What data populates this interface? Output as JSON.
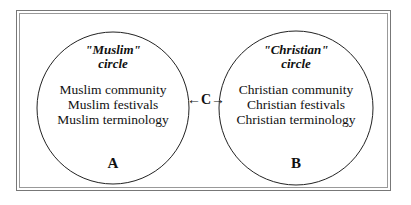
{
  "circles": [
    {
      "heading_line1": "\"Muslim\"",
      "heading_line2": "circle",
      "items": [
        "Muslim community",
        "Muslim festivals",
        "Muslim terminology"
      ],
      "label": "A"
    },
    {
      "heading_line1": "\"Christian\"",
      "heading_line2": "circle",
      "items": [
        "Christian community",
        "Christian festivals",
        "Christian terminology"
      ],
      "label": "B"
    }
  ],
  "connector": "←C→"
}
